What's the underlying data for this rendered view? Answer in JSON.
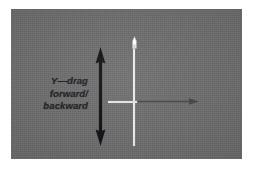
{
  "figure": {
    "name": "y-drag-axis-diagram",
    "background_color": "#ffffff",
    "panel_color": "#6e6e6e"
  },
  "labels": {
    "y_axis": "Y—drag\nforward/\nbackward",
    "y_axis_line1": "Y—drag",
    "y_axis_line2": "forward/",
    "y_axis_line3": "backward"
  },
  "annotations": {
    "y_arrow": {
      "icon": "double-headed-vertical-arrow-icon",
      "color": "#16161a",
      "direction": "up-down"
    },
    "x_arrow": {
      "icon": "right-arrow-icon",
      "color": "#3c3c40",
      "direction": "right"
    },
    "crosshair": {
      "icon": "crosshair-icon",
      "color": "#e9e9e9"
    },
    "cursor": {
      "icon": "mouse-pointer-icon",
      "color": "#f2f2f2"
    }
  }
}
